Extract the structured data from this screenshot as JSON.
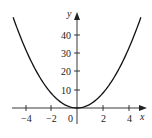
{
  "chart_data": {
    "type": "line",
    "title": "",
    "function": "y = 2x^2",
    "xlabel": "x",
    "ylabel": "y",
    "xlim": [
      -5,
      5
    ],
    "ylim": [
      -5,
      50
    ],
    "x_ticks": [
      -4,
      -2,
      0,
      2,
      4
    ],
    "x_tick_labels": [
      "−4",
      "−2",
      "0",
      "2",
      "4"
    ],
    "y_ticks": [
      10,
      20,
      30,
      40
    ],
    "y_tick_labels": [
      "10",
      "20",
      "30",
      "40"
    ],
    "grid": false,
    "legend": null,
    "series": [
      {
        "name": "parabola",
        "x": [
          -4.9,
          -4,
          -3,
          -2,
          -1,
          0,
          1,
          2,
          3,
          4,
          4.9
        ],
        "values": [
          48,
          32,
          18,
          8,
          2,
          0,
          2,
          8,
          18,
          32,
          48
        ]
      }
    ],
    "colors": {
      "curve": "#111111",
      "axes": "#222222"
    }
  }
}
